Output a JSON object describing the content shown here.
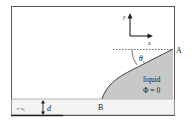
{
  "diagram": {
    "axes": {
      "x_label": "x",
      "y_label": "y"
    },
    "angle_label": "θ",
    "angle_subscript": "s",
    "point_a": "A",
    "point_b": "B",
    "liquid_label": "liquid",
    "phi_label": "Φ = 0",
    "substrate_label": "ε=ε",
    "substrate_subscript": "s",
    "thickness_label": "d",
    "colors": {
      "liquid_fill": "#c8c8c8",
      "substrate_fill": "#f4f4f4",
      "frame": "#333333",
      "background": "#ffffff"
    }
  }
}
